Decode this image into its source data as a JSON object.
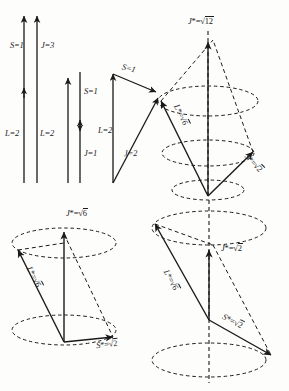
{
  "figure": {
    "ink_color": "#1a1a1a",
    "background": "#fdfdfc"
  },
  "vector_sum_diagrams": [
    {
      "name": "parallel-coupling",
      "labels": {
        "orbital": "L=2",
        "spin": "S=1",
        "total": "J=3"
      }
    },
    {
      "name": "antiparallel-coupling",
      "labels": {
        "orbital": "L=2",
        "spin": "S=1",
        "total": "J=1"
      }
    },
    {
      "name": "oblique-coupling",
      "labels": {
        "orbital": "L=2",
        "spin": "S=1",
        "total": "J=2"
      }
    }
  ],
  "cone_diagrams": [
    {
      "name": "cone-j-sqrt12",
      "total_symbol": "J",
      "total_star": "*",
      "total_eq": "=",
      "total_radicand": "12",
      "orbital_label": "L*=√6",
      "orbital_symbol": "L",
      "orbital_radicand": "6",
      "spin_symbol": "S",
      "spin_radicand": "2"
    },
    {
      "name": "cone-j-sqrt6",
      "total_symbol": "J",
      "total_star": "*",
      "total_eq": "=",
      "total_radicand": "6",
      "orbital_label": "L*=√6",
      "orbital_symbol": "L",
      "orbital_radicand": "6",
      "spin_symbol": "S",
      "spin_radicand": "2"
    },
    {
      "name": "cone-j-sqrt2",
      "total_symbol": "J",
      "total_star": "*",
      "total_eq": "=",
      "total_radicand": "2",
      "orbital_label": "L*=√6",
      "orbital_symbol": "L",
      "orbital_radicand": "6",
      "spin_symbol": "S",
      "spin_radicand": "2"
    }
  ],
  "text": {
    "L2_a": "L=2",
    "L2_b": "L=2",
    "L2_c": "L=2",
    "S1_a": "S=1",
    "S1_b": "S=1",
    "S1_c": "S=1",
    "J3": "J=3",
    "J1": "J=1",
    "J2": "J=2",
    "star": "*",
    "eq": "=",
    "J": "J",
    "L": "L",
    "S": "S",
    "r12": "12",
    "r6a": "6",
    "r6b": "6",
    "r6c": "6",
    "r6d": "6",
    "r2a": "2",
    "r2b": "2",
    "r2c": "2",
    "r2d": "2"
  }
}
